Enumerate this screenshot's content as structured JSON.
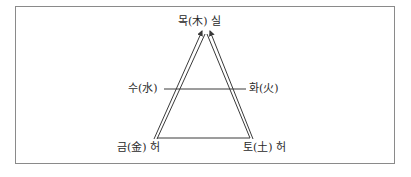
{
  "diagram": {
    "type": "five-elements-triangle",
    "nodes": {
      "top": "목(木) 실",
      "left_mid": "수(水)",
      "right_mid": "화(火)",
      "bottom_left": "금(金) 허",
      "bottom_right": "토(土) 허"
    },
    "colors": {
      "line": "#3a3a3a",
      "frame": "#8a8a8a",
      "text": "#2a2a2a"
    }
  }
}
